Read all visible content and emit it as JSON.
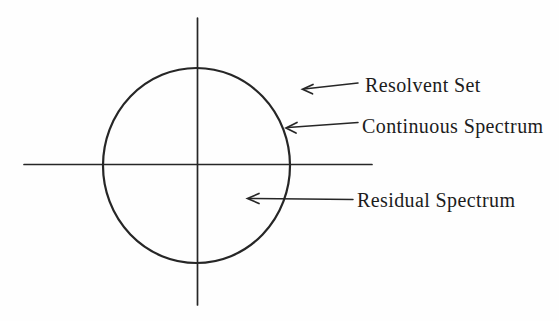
{
  "figure": {
    "labels": {
      "resolvent": "Resolvent Set",
      "continuous": "Continuous Spectrum",
      "residual": "Residual Spectrum"
    },
    "annotations": [
      {
        "label": "Resolvent Set",
        "points_to": "region outside the circle"
      },
      {
        "label": "Continuous Spectrum",
        "points_to": "circle boundary"
      },
      {
        "label": "Residual Spectrum",
        "points_to": "region inside the circle"
      }
    ],
    "colors": {
      "background": "#fefefe",
      "line": "#262626",
      "text": "#1c1c1c"
    }
  }
}
